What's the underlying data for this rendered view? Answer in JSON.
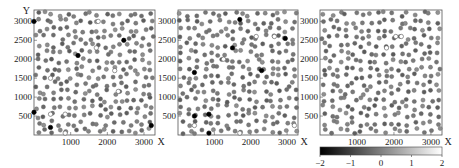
{
  "chart_data": [
    {
      "type": "scatter",
      "title": "",
      "xlabel": "X",
      "ylabel": "Y",
      "xlim": [
        0,
        3300
      ],
      "ylim": [
        0,
        3300
      ],
      "x_ticks": [
        1000,
        2000,
        3000
      ],
      "y_ticks": [
        500,
        1000,
        1500,
        2000,
        2500,
        3000
      ],
      "grid": false,
      "color_encoding": "grayscale value in [-2, 2]",
      "points_note": "Dots form a roughly uniform jittered lattice, about 16 per row. Positions and values in this recreation are synthetic (seeded generator), not read from the image. A few dark (~-2) and hollow/white (~+2) outliers are visible.",
      "notable_points": [
        {
          "x": 0,
          "y": 3000,
          "value": -2
        },
        {
          "x": 2450,
          "y": 2500,
          "value": -2
        },
        {
          "x": 1200,
          "y": 2100,
          "value": -2
        },
        {
          "x": 1700,
          "y": 2300,
          "value": 2
        },
        {
          "x": 1750,
          "y": 3000,
          "value": 2
        },
        {
          "x": 2200,
          "y": 1700,
          "value": 2
        },
        {
          "x": 450,
          "y": 1500,
          "value": 2
        },
        {
          "x": 2300,
          "y": 1150,
          "value": 2
        },
        {
          "x": 0,
          "y": 600,
          "value": -2
        },
        {
          "x": 450,
          "y": 200,
          "value": -2
        },
        {
          "x": 450,
          "y": 550,
          "value": 2
        },
        {
          "x": 850,
          "y": 550,
          "value": 2
        },
        {
          "x": 850,
          "y": 50,
          "value": 2
        },
        {
          "x": 3200,
          "y": 250,
          "value": -2
        }
      ]
    },
    {
      "type": "scatter",
      "title": "",
      "xlabel": "X",
      "ylabel": "",
      "xlim": [
        0,
        3300
      ],
      "ylim": [
        0,
        3300
      ],
      "x_ticks": [
        1000,
        2000,
        3000
      ],
      "y_ticks": [
        500,
        1000,
        1500,
        2000,
        2500,
        3000
      ],
      "grid": false,
      "color_encoding": "grayscale value in [-2, 2]",
      "points_note": "Jittered lattice, positions and values synthetic. Several dark outliers and a few hollow outliers are visible.",
      "notable_points": [
        {
          "x": 1700,
          "y": 3050,
          "value": -2
        },
        {
          "x": 1500,
          "y": 2300,
          "value": -2
        },
        {
          "x": 2950,
          "y": 2550,
          "value": -2
        },
        {
          "x": 450,
          "y": 1650,
          "value": -2
        },
        {
          "x": 2300,
          "y": 1700,
          "value": -2
        },
        {
          "x": 450,
          "y": 500,
          "value": -2
        },
        {
          "x": 850,
          "y": 550,
          "value": -2
        },
        {
          "x": 850,
          "y": 50,
          "value": -2
        },
        {
          "x": 2150,
          "y": 2600,
          "value": 2
        },
        {
          "x": 2650,
          "y": 2600,
          "value": 2
        },
        {
          "x": 1250,
          "y": 2000,
          "value": 2
        },
        {
          "x": 450,
          "y": 250,
          "value": 2
        },
        {
          "x": 1700,
          "y": 50,
          "value": 2
        },
        {
          "x": 3200,
          "y": 250,
          "value": 2
        }
      ]
    },
    {
      "type": "scatter",
      "title": "",
      "xlabel": "X",
      "ylabel": "",
      "xlim": [
        0,
        3300
      ],
      "ylim": [
        0,
        3300
      ],
      "x_ticks": [
        1000,
        2000,
        3000
      ],
      "y_ticks": [
        500,
        1000,
        1500,
        2000,
        2500,
        3000
      ],
      "grid": false,
      "color_encoding": "grayscale value in [-2, 2]",
      "points_note": "Jittered lattice, mostly mid-gray, positions and values synthetic. A few hollow outliers near the upper center.",
      "notable_points": [
        {
          "x": 2050,
          "y": 2600,
          "value": 2
        },
        {
          "x": 2200,
          "y": 2600,
          "value": 2
        },
        {
          "x": 1800,
          "y": 2300,
          "value": 2
        }
      ]
    }
  ],
  "colorbar": {
    "min": -2,
    "max": 2,
    "ticks": [
      "-2",
      "-1",
      "0",
      "1",
      "2"
    ],
    "colormap": "gray (black to white)"
  },
  "labels": {
    "x_axis": "X",
    "y_axis": "Y",
    "x_ticks": [
      "1000",
      "2000",
      "3000"
    ],
    "y_ticks": [
      "500",
      "1000",
      "1500",
      "2000",
      "2500",
      "3000"
    ]
  }
}
